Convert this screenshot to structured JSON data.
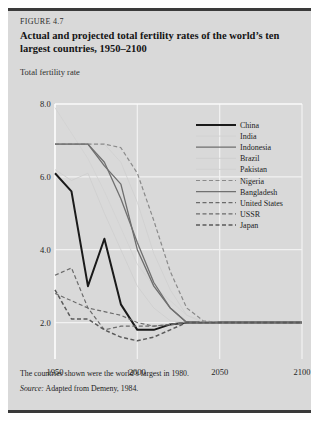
{
  "figure": {
    "number": "FIGURE 4.7",
    "title": "Actual and projected total fertility rates of the world’s ten largest countries, 1950–2100",
    "axis_title": "Total fertility rate",
    "footnote": "The countries shown were the world’s largest in 1980.",
    "source_label": "Source:",
    "source_text": "Adapted from Demeny, 1984."
  },
  "colors": {
    "page_background": "#ffffff",
    "panel_background": "#d9d9d9",
    "panel_border": "#3a3a3a",
    "gridline": "#f2f2f2",
    "axis_line": "#ffffff",
    "text": "#1c1c1c",
    "china": "#1a1a1a",
    "india": "#d2d2d2",
    "indonesia": "#6e6e6e",
    "brazil": "#cfcfcf",
    "pakistan": "#d0d0d0",
    "nigeria": "#8a8a8a",
    "bangladesh": "#707070",
    "united_states": "#6b6b6b",
    "ussr": "#6b6b6b",
    "japan": "#5a5a5a"
  },
  "chart_data": {
    "type": "line",
    "title": "Actual and projected total fertility rates of the world’s ten largest countries, 1950–2100",
    "xlabel": "",
    "ylabel": "Total fertility rate",
    "xlim": [
      1950,
      2100
    ],
    "ylim": [
      1.0,
      8.0
    ],
    "xticks": [
      1950,
      2000,
      2050,
      2100
    ],
    "xtick_labels": [
      "1950",
      "2000",
      "2050",
      "2100"
    ],
    "yticks": [
      2.0,
      4.0,
      6.0,
      8.0
    ],
    "ytick_labels": [
      "2.0",
      "4.0",
      "6.0",
      "8.0"
    ],
    "grid": true,
    "legend_position": "right-top",
    "x": [
      1950,
      1960,
      1970,
      1980,
      1990,
      2000,
      2010,
      2020,
      2030,
      2040,
      2050,
      2060,
      2070,
      2080,
      2090,
      2100
    ],
    "series": [
      {
        "name": "China",
        "style": "solid",
        "width": 2.0,
        "color": "#1a1a1a",
        "values": [
          6.1,
          5.6,
          3.0,
          4.3,
          2.5,
          1.8,
          1.8,
          1.95,
          2.0,
          2.0,
          2.0,
          2.0,
          2.0,
          2.0,
          2.0,
          2.0
        ]
      },
      {
        "name": "India",
        "style": "solid",
        "width": 0.9,
        "color": "#d2d2d2",
        "values": [
          7.9,
          7.2,
          6.5,
          5.6,
          4.6,
          3.6,
          3.0,
          2.6,
          2.2,
          2.05,
          2.0,
          2.0,
          2.0,
          2.0,
          2.0,
          2.0
        ]
      },
      {
        "name": "Indonesia",
        "style": "solid",
        "width": 1.3,
        "color": "#6e6e6e",
        "values": [
          6.9,
          6.9,
          6.9,
          6.3,
          5.8,
          4.0,
          3.0,
          2.4,
          2.0,
          2.0,
          2.0,
          2.0,
          2.0,
          2.0,
          2.0,
          2.0
        ]
      },
      {
        "name": "Brazil",
        "style": "solid",
        "width": 0.9,
        "color": "#cfcfcf",
        "values": [
          6.2,
          5.9,
          6.1,
          5.0,
          4.0,
          3.0,
          2.4,
          2.05,
          2.0,
          2.0,
          2.0,
          2.0,
          2.0,
          2.0,
          2.0,
          2.0
        ]
      },
      {
        "name": "Pakistan",
        "style": "solid",
        "width": 0.9,
        "color": "#d0d0d0",
        "values": [
          6.9,
          6.9,
          6.9,
          6.9,
          6.4,
          5.3,
          3.9,
          2.9,
          2.2,
          2.0,
          2.0,
          2.0,
          2.0,
          2.0,
          2.0,
          2.0
        ]
      },
      {
        "name": "Nigeria",
        "style": "dashed",
        "width": 1.2,
        "color": "#8a8a8a",
        "values": [
          6.9,
          6.9,
          6.9,
          6.9,
          6.8,
          6.1,
          4.8,
          3.4,
          2.4,
          2.05,
          2.0,
          2.0,
          2.0,
          2.0,
          2.0,
          2.0
        ]
      },
      {
        "name": "Bangladesh",
        "style": "solid",
        "width": 1.3,
        "color": "#707070",
        "values": [
          6.9,
          6.9,
          6.9,
          6.4,
          5.4,
          4.2,
          3.1,
          2.4,
          2.0,
          2.0,
          2.0,
          2.0,
          2.0,
          2.0,
          2.0,
          2.0
        ]
      },
      {
        "name": "United States",
        "style": "dashed",
        "width": 1.2,
        "color": "#6b6b6b",
        "values": [
          3.3,
          3.5,
          2.4,
          1.8,
          1.9,
          1.9,
          1.9,
          1.95,
          2.0,
          2.0,
          2.0,
          2.0,
          2.0,
          2.0,
          2.0,
          2.0
        ]
      },
      {
        "name": "USSR",
        "style": "dashed",
        "width": 1.2,
        "color": "#6b6b6b",
        "values": [
          2.8,
          2.6,
          2.4,
          2.3,
          2.2,
          2.0,
          1.9,
          1.95,
          2.0,
          2.0,
          2.0,
          2.0,
          2.0,
          2.0,
          2.0,
          2.0
        ]
      },
      {
        "name": "Japan",
        "style": "dashed",
        "width": 1.5,
        "color": "#5a5a5a",
        "values": [
          2.9,
          2.1,
          2.1,
          1.8,
          1.6,
          1.5,
          1.6,
          1.8,
          2.0,
          2.0,
          2.0,
          2.0,
          2.0,
          2.0,
          2.0,
          2.0
        ]
      }
    ]
  }
}
